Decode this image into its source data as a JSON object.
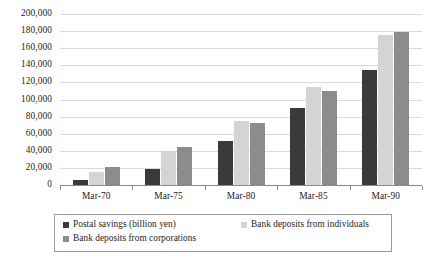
{
  "chart_data": {
    "type": "bar",
    "title": "",
    "subtitle": "",
    "xlabel": "",
    "ylabel": "",
    "categories": [
      "Mar-70",
      "Mar-75",
      "Mar-80",
      "Mar-85",
      "Mar-90"
    ],
    "series": [
      {
        "name": "Postal savings (billion yen)",
        "color": "#3a3a3a",
        "values": [
          6000,
          19000,
          52000,
          90000,
          134000
        ]
      },
      {
        "name": "Bank deposits from individuals",
        "color": "#d4d4d4",
        "values": [
          15000,
          39500,
          75000,
          115000,
          176000
        ]
      },
      {
        "name": "Bank deposits from corporations",
        "color": "#8c8c8c",
        "values": [
          20500,
          45000,
          72000,
          110000,
          179000
        ]
      }
    ],
    "ylim": [
      0,
      200000
    ],
    "ytick_step": 20000,
    "ytick_labels": [
      "200,000",
      "180,000",
      "160,000",
      "140,000",
      "120,000",
      "100,000",
      "80,000",
      "60,000",
      "40,000",
      "20,000",
      "0"
    ],
    "grid": true,
    "grid_color": "#d9d9d9",
    "axis_color": "#8a8a8a",
    "legend_position": "bottom",
    "legend_border_color": "#9a9a9a"
  },
  "caption": {
    "text": ""
  }
}
